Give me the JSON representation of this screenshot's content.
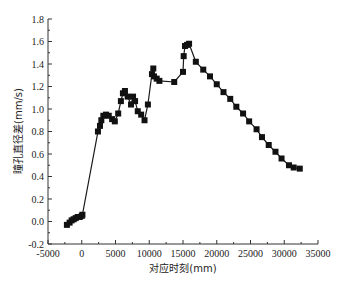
{
  "chart_data": {
    "type": "line",
    "title": "",
    "xlabel": "对应时刻(mm)",
    "ylabel": "瞳孔直径差(mm/s)",
    "xlim": [
      -5000,
      35000
    ],
    "ylim": [
      -0.2,
      1.8
    ],
    "xticks": [
      -5000,
      0,
      5000,
      10000,
      15000,
      20000,
      25000,
      30000,
      35000
    ],
    "yticks": [
      -0.2,
      0.0,
      0.2,
      0.4,
      0.6,
      0.8,
      1.0,
      1.2,
      1.4,
      1.6,
      1.8
    ],
    "grid": false,
    "legend": null,
    "marker": "square",
    "series": [
      {
        "name": "瞳孔直径差",
        "x": [
          -2200,
          -1800,
          -1500,
          -1200,
          -900,
          -600,
          -300,
          0,
          100,
          2400,
          2700,
          2900,
          3200,
          3600,
          4000,
          4500,
          4900,
          5400,
          5800,
          6100,
          6400,
          6800,
          7300,
          7600,
          7900,
          8300,
          8800,
          9300,
          9800,
          10400,
          10600,
          10700,
          11100,
          11500,
          13700,
          15000,
          15100,
          15300,
          15600,
          15900,
          16900,
          18000,
          19000,
          20000,
          21000,
          22000,
          22900,
          23900,
          24800,
          25900,
          26700,
          27700,
          28700,
          29600,
          30700,
          31400,
          32300
        ],
        "values": [
          -0.03,
          -0.01,
          0.01,
          0.02,
          0.03,
          0.04,
          0.04,
          0.05,
          0.06,
          0.8,
          0.85,
          0.9,
          0.94,
          0.95,
          0.94,
          0.91,
          0.89,
          0.96,
          1.07,
          1.14,
          1.16,
          1.11,
          1.04,
          1.11,
          1.07,
          0.98,
          0.95,
          0.9,
          1.04,
          1.31,
          1.36,
          1.29,
          1.27,
          1.25,
          1.24,
          1.33,
          1.47,
          1.56,
          1.57,
          1.58,
          1.42,
          1.35,
          1.29,
          1.22,
          1.15,
          1.09,
          1.02,
          0.96,
          0.89,
          0.82,
          0.75,
          0.68,
          0.62,
          0.56,
          0.5,
          0.48,
          0.47
        ]
      }
    ]
  },
  "plot_area": {
    "left": 48,
    "top": 19,
    "right": 318,
    "bottom": 244
  },
  "colors": {
    "line": "#1a1a1a",
    "marker": "#111111",
    "axis": "#333333",
    "background": "#ffffff"
  }
}
